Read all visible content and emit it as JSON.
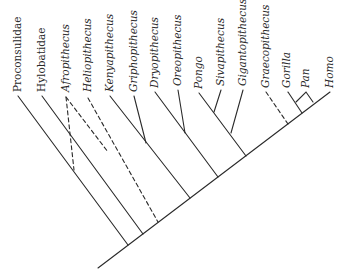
{
  "diagram": {
    "type": "cladogram",
    "taxa": [
      {
        "name": "Proconsulidae",
        "italic": false
      },
      {
        "name": "Hylobatidae",
        "italic": false
      },
      {
        "name": "Afropithecus",
        "italic": true,
        "uncertain": true
      },
      {
        "name": "Heliopithecus",
        "italic": true,
        "uncertain": true
      },
      {
        "name": "Kenyapithecus",
        "italic": true
      },
      {
        "name": "Griphopithecus",
        "italic": true
      },
      {
        "name": "Dryopithecus",
        "italic": true
      },
      {
        "name": "Oreopithecus",
        "italic": true
      },
      {
        "name": "Pongo",
        "italic": true
      },
      {
        "name": "Sivapithecus",
        "italic": true
      },
      {
        "name": "Gigantopithecus",
        "italic": true
      },
      {
        "name": "Graecopithecus",
        "italic": true,
        "uncertain": true
      },
      {
        "name": "Gorilla",
        "italic": true
      },
      {
        "name": "Pan",
        "italic": true
      },
      {
        "name": "Homo",
        "italic": true
      }
    ],
    "legend": {
      "solid_line": "established relationship",
      "dashed_line": "uncertain placement"
    },
    "colors": {
      "line": "#2a2a2a",
      "background": "#ffffff"
    }
  }
}
